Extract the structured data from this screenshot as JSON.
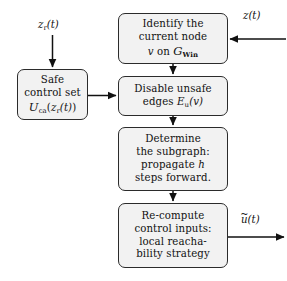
{
  "diagram": {
    "type": "flowchart",
    "style": {
      "box_fill": "#f2f2f2",
      "box_border": "#2b2b2b",
      "arrow_color": "#111111",
      "background": "#ffffff"
    },
    "nodes": [
      {
        "id": "identify",
        "name": "identify-current-node",
        "lines": [
          "Identify the",
          "current node",
          "v on G_Win"
        ],
        "line1": "Identify the",
        "line2": "current node",
        "math_var": "v",
        "math_on": "on",
        "math_graph": "G",
        "math_graph_sub": "Win"
      },
      {
        "id": "safe",
        "name": "safe-control-set",
        "line1": "Safe",
        "line2": "control set",
        "math_set": "U",
        "math_set_sub": "ca",
        "math_arg_open": "(",
        "math_arg_var": "z",
        "math_arg_sub": "r",
        "math_arg_t": "(t)",
        "math_arg_close": ")"
      },
      {
        "id": "disable",
        "name": "disable-unsafe-edges",
        "line1": "Disable unsafe",
        "line2_prefix": "edges",
        "math_edges": "E",
        "math_edges_sub": "u",
        "math_edges_arg": "(v)"
      },
      {
        "id": "determine",
        "name": "determine-subgraph",
        "line1": "Determine",
        "line2": "the subgraph:",
        "line3_prefix": "propagate",
        "line3_math": "h",
        "line4": "steps forward."
      },
      {
        "id": "recompute",
        "name": "recompute-control-inputs",
        "line1": "Re-compute",
        "line2": "control inputs:",
        "line3": "local reacha-",
        "line4": "bility strategy"
      }
    ],
    "labels": {
      "input_zr": {
        "name": "signal-label-zr",
        "var": "z",
        "sub": "r",
        "arg": "(t)"
      },
      "input_z": {
        "name": "signal-label-z",
        "var": "z",
        "arg": "(t)"
      },
      "output_u": {
        "name": "signal-label-u-tilde",
        "var": "u",
        "accent": "~",
        "arg": "(t)"
      }
    },
    "edges": [
      {
        "name": "edge-zr-to-safe",
        "from": "input z_r(t)",
        "to": "safe",
        "direction": "down"
      },
      {
        "name": "edge-z-to-identify",
        "from": "input z(t)",
        "to": "identify",
        "direction": "left"
      },
      {
        "name": "edge-identify-to-disable",
        "from": "identify",
        "to": "disable",
        "direction": "down"
      },
      {
        "name": "edge-safe-to-disable",
        "from": "safe",
        "to": "disable",
        "direction": "right"
      },
      {
        "name": "edge-disable-to-determine",
        "from": "disable",
        "to": "determine",
        "direction": "down"
      },
      {
        "name": "edge-determine-to-recompute",
        "from": "determine",
        "to": "recompute",
        "direction": "down"
      },
      {
        "name": "edge-recompute-to-output",
        "from": "recompute",
        "to": "output u~(t)",
        "direction": "right"
      }
    ]
  }
}
